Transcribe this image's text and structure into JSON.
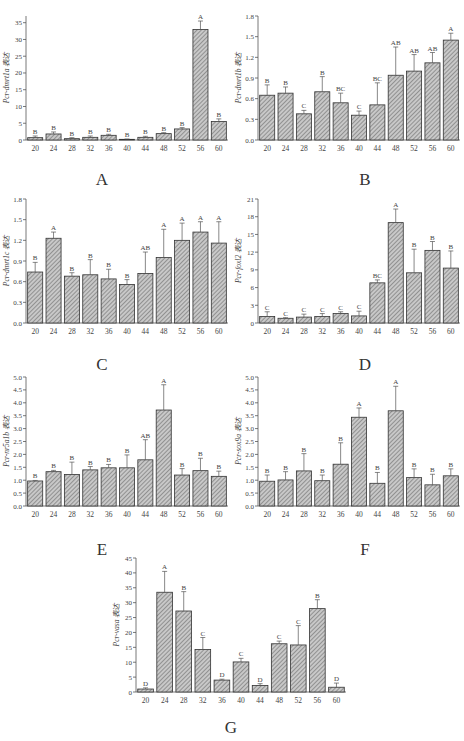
{
  "figure": {
    "x_categories": [
      "20",
      "24",
      "28",
      "32",
      "36",
      "40",
      "44",
      "48",
      "52",
      "56",
      "60"
    ],
    "expression_suffix": "表达"
  },
  "chart_data": [
    {
      "panel": "A",
      "type": "bar",
      "title": "",
      "xlabel": "",
      "ylabel": "Pcr-dmrt1a 表达",
      "categories": [
        "20",
        "24",
        "28",
        "32",
        "36",
        "40",
        "44",
        "48",
        "52",
        "56",
        "60"
      ],
      "values": [
        0.7,
        1.8,
        0.4,
        0.8,
        1.4,
        0.2,
        0.8,
        1.9,
        3.3,
        33.0,
        5.5
      ],
      "errors": [
        0.5,
        0.6,
        0.3,
        0.4,
        0.3,
        0.1,
        0.3,
        0.3,
        0.4,
        2.5,
        0.8
      ],
      "letters": [
        "B",
        "B",
        "B",
        "B",
        "B",
        "B",
        "B",
        "B",
        "B",
        "A",
        "B"
      ],
      "ylim": [
        0,
        37
      ],
      "yticks": [
        0,
        5,
        10,
        15,
        20,
        25,
        30,
        35
      ],
      "grid": false,
      "legend": "none"
    },
    {
      "panel": "B",
      "type": "bar",
      "title": "",
      "xlabel": "",
      "ylabel": "Pcr-dmrt1b 表达",
      "categories": [
        "20",
        "24",
        "28",
        "32",
        "36",
        "40",
        "44",
        "48",
        "52",
        "56",
        "60"
      ],
      "values": [
        0.65,
        0.68,
        0.38,
        0.7,
        0.54,
        0.36,
        0.51,
        0.94,
        1.0,
        1.12,
        1.45
      ],
      "errors": [
        0.15,
        0.09,
        0.05,
        0.22,
        0.14,
        0.06,
        0.32,
        0.41,
        0.24,
        0.15,
        0.1
      ],
      "letters": [
        "B",
        "B",
        "C",
        "B",
        "BC",
        "C",
        "BC",
        "AB",
        "AB",
        "AB",
        "A"
      ],
      "ylim": [
        0,
        1.8
      ],
      "yticks": [
        0.0,
        0.3,
        0.6,
        0.9,
        1.2,
        1.5,
        1.8
      ],
      "grid": false,
      "legend": "none"
    },
    {
      "panel": "C",
      "type": "bar",
      "title": "",
      "xlabel": "",
      "ylabel": "Pcr-dmrt1c 表达",
      "categories": [
        "20",
        "24",
        "28",
        "32",
        "36",
        "40",
        "44",
        "48",
        "52",
        "56",
        "60"
      ],
      "values": [
        0.74,
        1.23,
        0.68,
        0.7,
        0.64,
        0.56,
        0.72,
        0.95,
        1.2,
        1.32,
        1.16
      ],
      "errors": [
        0.14,
        0.09,
        0.05,
        0.22,
        0.14,
        0.07,
        0.31,
        0.41,
        0.25,
        0.15,
        0.31
      ],
      "letters": [
        "B",
        "A",
        "B",
        "B",
        "B",
        "B",
        "AB",
        "A",
        "A",
        "A",
        "A"
      ],
      "ylim": [
        0,
        1.8
      ],
      "yticks": [
        0.0,
        0.3,
        0.6,
        0.9,
        1.2,
        1.5,
        1.8
      ],
      "grid": false,
      "legend": "none"
    },
    {
      "panel": "D",
      "type": "bar",
      "title": "",
      "xlabel": "",
      "ylabel": "Pcr-foxl2 表达",
      "categories": [
        "20",
        "24",
        "28",
        "32",
        "36",
        "40",
        "44",
        "48",
        "52",
        "56",
        "60"
      ],
      "values": [
        1.1,
        0.8,
        1.0,
        1.1,
        1.6,
        1.2,
        6.8,
        17.0,
        8.5,
        12.3,
        9.3
      ],
      "errors": [
        0.8,
        0.1,
        0.5,
        0.5,
        0.3,
        0.8,
        0.5,
        2.3,
        4.0,
        1.5,
        2.9
      ],
      "letters": [
        "C",
        "C",
        "C",
        "C",
        "C",
        "C",
        "BC",
        "A",
        "B",
        "B",
        "B"
      ],
      "ylim": [
        0,
        21
      ],
      "yticks": [
        0,
        3,
        6,
        9,
        12,
        15,
        18,
        21
      ],
      "grid": false,
      "legend": "none"
    },
    {
      "panel": "E",
      "type": "bar",
      "title": "",
      "xlabel": "",
      "ylabel": "Pcr-nr5a1b 表达",
      "categories": [
        "20",
        "24",
        "28",
        "32",
        "36",
        "40",
        "44",
        "48",
        "52",
        "56",
        "60"
      ],
      "values": [
        0.97,
        1.33,
        1.22,
        1.4,
        1.48,
        1.48,
        1.79,
        3.72,
        1.2,
        1.37,
        1.15
      ],
      "errors": [
        0.02,
        0.05,
        0.48,
        0.13,
        0.13,
        0.5,
        0.78,
        0.98,
        0.25,
        0.48,
        0.2
      ],
      "letters": [
        "B",
        "B",
        "B",
        "B",
        "B",
        "B",
        "AB",
        "A",
        "B",
        "B",
        "B"
      ],
      "ylim": [
        0,
        5.0
      ],
      "yticks": [
        0.0,
        0.5,
        1.0,
        1.5,
        2.0,
        2.5,
        3.0,
        3.5,
        4.0,
        4.5,
        5.0
      ],
      "grid": false,
      "legend": "none"
    },
    {
      "panel": "F",
      "type": "bar",
      "title": "",
      "xlabel": "",
      "ylabel": "Pcr-sox9a 表达",
      "categories": [
        "20",
        "24",
        "28",
        "32",
        "36",
        "40",
        "44",
        "48",
        "52",
        "56",
        "60"
      ],
      "values": [
        0.96,
        1.01,
        1.36,
        0.98,
        1.62,
        3.44,
        0.88,
        3.69,
        1.1,
        0.82,
        1.17
      ],
      "errors": [
        0.24,
        0.32,
        0.67,
        0.22,
        0.83,
        0.36,
        0.42,
        0.95,
        0.34,
        0.41,
        0.27
      ],
      "letters": [
        "B",
        "B",
        "B",
        "B",
        "B",
        "A",
        "B",
        "A",
        "B",
        "B",
        "B"
      ],
      "ylim": [
        0,
        5.0
      ],
      "yticks": [
        0.0,
        0.5,
        1.0,
        1.5,
        2.0,
        2.5,
        3.0,
        3.5,
        4.0,
        4.5,
        5.0
      ],
      "grid": false,
      "legend": "none"
    },
    {
      "panel": "G",
      "type": "bar",
      "title": "",
      "xlabel": "",
      "ylabel": "Pcr-vasa 表达",
      "categories": [
        "20",
        "24",
        "28",
        "32",
        "36",
        "40",
        "44",
        "48",
        "52",
        "56",
        "60"
      ],
      "values": [
        1.0,
        33.5,
        27.2,
        14.3,
        4.0,
        10.1,
        2.2,
        16.2,
        15.8,
        28.0,
        1.6
      ],
      "errors": [
        0.4,
        7.0,
        6.5,
        4.0,
        0.3,
        1.2,
        0.6,
        0.9,
        6.5,
        3.0,
        1.4
      ],
      "letters": [
        "D",
        "A",
        "B",
        "C",
        "D",
        "C",
        "D",
        "C",
        "C",
        "B",
        "D"
      ],
      "ylim": [
        0,
        45
      ],
      "yticks": [
        0,
        5,
        10,
        15,
        20,
        25,
        30,
        35,
        40,
        45
      ],
      "grid": false,
      "legend": "none"
    }
  ],
  "layout": {
    "bar_fill": "#9a9a9a",
    "bar_stroke": "#333333",
    "axis_color": "#555555"
  }
}
